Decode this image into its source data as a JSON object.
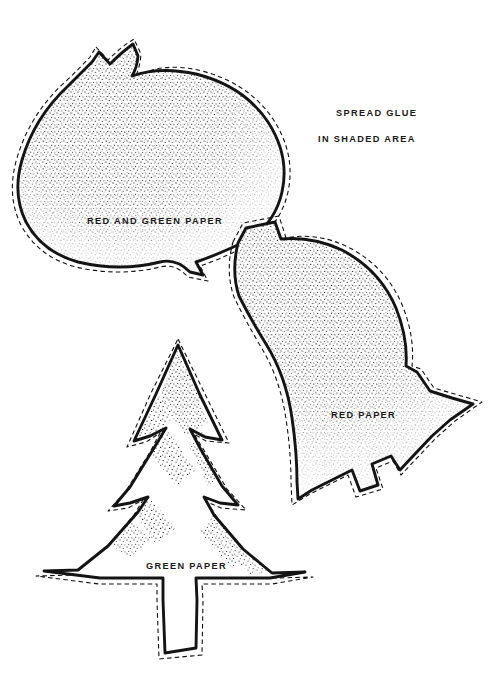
{
  "page": {
    "background_color": "#ffffff",
    "ink_color": "#141414",
    "width": 504,
    "height": 699
  },
  "instructions": {
    "line1": "SPREAD GLUE",
    "line2": "IN SHADED AREA"
  },
  "patterns": [
    {
      "id": "onion-ornament",
      "label": "RED AND GREEN PAPER",
      "shape": "teardrop-ornament",
      "shaded": true
    },
    {
      "id": "bell-ornament",
      "label": "RED PAPER",
      "shape": "bell",
      "shaded": true
    },
    {
      "id": "tree-ornament",
      "label": "GREEN PAPER",
      "shape": "christmas-tree",
      "shaded": true
    }
  ],
  "legend": {
    "solid_line": "fold / draw line",
    "dashed_line": "cut line"
  }
}
